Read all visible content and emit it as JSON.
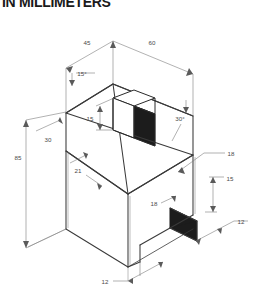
{
  "sheet": {
    "title": "IN MILLIMETERS",
    "width": 259,
    "height": 293,
    "background": "#ffffff"
  },
  "drawing": {
    "type": "isometric-technical-drawing",
    "subject": "house-shaped block with roof, chimney and bottom notch",
    "line_color": "#3a3a3a",
    "dim_color": "#6a6a6a",
    "shade_color": "#1c1c1c",
    "face_color": "#ffffff"
  },
  "dimensions": {
    "top_left_width": "45",
    "top_right_width": "60",
    "roof_angle_left": "15°",
    "roof_angle_right": "30°",
    "chimney_height": "15",
    "left_upper_offset": "30",
    "overall_height": "85",
    "left_lower_offset": "21",
    "notch_inner_depth": "18",
    "right_upper_offset": "18",
    "right_notch_height": "15",
    "right_notch_width": "12",
    "bottom_notch_width": "12"
  },
  "labels": [
    {
      "name": "dim-45",
      "text": "45",
      "x": 87,
      "y": 45
    },
    {
      "name": "dim-60",
      "text": "60",
      "x": 152,
      "y": 45
    },
    {
      "name": "dim-15-deg",
      "text": "15°",
      "x": 80,
      "y": 76
    },
    {
      "name": "dim-30-deg",
      "text": "30°",
      "x": 179,
      "y": 115
    },
    {
      "name": "dim-15",
      "text": "15",
      "x": 89,
      "y": 119
    },
    {
      "name": "dim-30",
      "text": "30",
      "x": 48,
      "y": 142
    },
    {
      "name": "dim-85",
      "text": "85",
      "x": 18,
      "y": 158
    },
    {
      "name": "dim-21",
      "text": "21",
      "x": 78,
      "y": 172
    },
    {
      "name": "dim-18-right",
      "text": "18",
      "x": 228,
      "y": 156
    },
    {
      "name": "dim-15-right",
      "text": "15",
      "x": 227,
      "y": 183
    },
    {
      "name": "dim-18-inner",
      "text": "18",
      "x": 153,
      "y": 205
    },
    {
      "name": "dim-12-right",
      "text": "12",
      "x": 238,
      "y": 224
    },
    {
      "name": "dim-12-bottom",
      "text": "12",
      "x": 127,
      "y": 272
    }
  ]
}
